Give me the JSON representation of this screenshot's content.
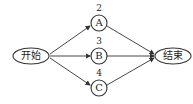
{
  "diagram": {
    "type": "activity-network",
    "start": {
      "label": "开始"
    },
    "end": {
      "label": "结束"
    },
    "nodes": [
      {
        "id": "A",
        "label": "A",
        "weight": "2"
      },
      {
        "id": "B",
        "label": "B",
        "weight": "3"
      },
      {
        "id": "C",
        "label": "C",
        "weight": "4"
      }
    ],
    "edges": [
      {
        "from": "开始",
        "to": "A"
      },
      {
        "from": "开始",
        "to": "B"
      },
      {
        "from": "开始",
        "to": "C"
      },
      {
        "from": "A",
        "to": "结束"
      },
      {
        "from": "B",
        "to": "结束"
      },
      {
        "from": "C",
        "to": "结束"
      }
    ]
  }
}
